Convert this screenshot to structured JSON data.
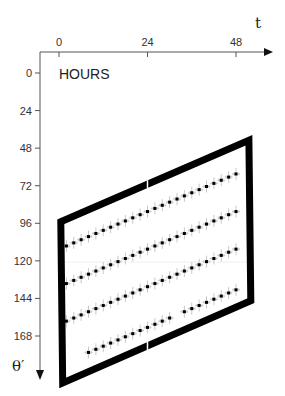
{
  "chart_data": {
    "type": "scatter",
    "title": "",
    "units_label": "HOURS",
    "xlabel": "t",
    "ylabel": "θ′",
    "x_ticks": [
      0,
      24,
      48
    ],
    "y_ticks": [
      0,
      24,
      48,
      72,
      96,
      120,
      144,
      168
    ],
    "xlim": [
      0,
      54
    ],
    "ylim": [
      0,
      180
    ],
    "y_inverted": true,
    "grid": false,
    "legend": null,
    "frame": {
      "description": "thick black parallelogram enclosing the data",
      "corners_t_theta": [
        [
          0.5,
          95
        ],
        [
          51.5,
          43
        ],
        [
          52,
          145.5
        ],
        [
          1,
          198
        ]
      ]
    },
    "series": [
      {
        "name": "row-1",
        "t": [
          2,
          4,
          6,
          8,
          10,
          12,
          14,
          16,
          18,
          20,
          22,
          24,
          26,
          28,
          30,
          32,
          34,
          36,
          38,
          40,
          42,
          44,
          46,
          48
        ],
        "theta": [
          110.5,
          108.5,
          106.5,
          104.5,
          102.5,
          100.5,
          98.5,
          96.5,
          94.5,
          92.5,
          90.5,
          88.5,
          86.5,
          84.5,
          82.5,
          80.5,
          78.5,
          76.5,
          74.5,
          72.5,
          70.5,
          68.5,
          66.5,
          64.5
        ]
      },
      {
        "name": "row-2",
        "t": [
          2,
          4,
          6,
          8,
          10,
          12,
          14,
          16,
          18,
          20,
          22,
          24,
          26,
          28,
          30,
          32,
          34,
          36,
          38,
          40,
          42,
          44,
          46,
          48
        ],
        "theta": [
          134.5,
          132.5,
          130.5,
          128.5,
          126.5,
          124.5,
          122.5,
          120.5,
          118.5,
          116.5,
          114.5,
          112.5,
          110.5,
          108.5,
          106.5,
          104.5,
          102.5,
          100.5,
          98.5,
          96.5,
          94.5,
          92.5,
          90.5,
          88.5
        ]
      },
      {
        "name": "row-3",
        "t": [
          2,
          4,
          6,
          8,
          10,
          12,
          14,
          16,
          18,
          20,
          22,
          24,
          26,
          28,
          30,
          32,
          34,
          36,
          38,
          40,
          42,
          44,
          46,
          48
        ],
        "theta": [
          158.5,
          156.5,
          154.5,
          152.5,
          150.5,
          148.5,
          146.5,
          144.5,
          142.5,
          140.5,
          138.5,
          136.5,
          134.5,
          132.5,
          130.5,
          128.5,
          126.5,
          124.5,
          122.5,
          120.5,
          118.5,
          116.5,
          114.5,
          112.5
        ]
      },
      {
        "name": "row-4",
        "t": [
          8,
          10,
          12,
          14,
          16,
          18,
          20,
          22,
          24,
          26,
          28,
          30,
          34,
          36,
          38,
          40,
          42,
          44,
          46,
          48
        ],
        "theta": [
          178.5,
          176.5,
          174.5,
          172.5,
          170.5,
          168.5,
          166.5,
          164.5,
          162.5,
          160.5,
          158.5,
          156.5,
          152.5,
          150.5,
          148.5,
          146.5,
          144.5,
          142.5,
          140.5,
          138.5
        ]
      }
    ]
  }
}
